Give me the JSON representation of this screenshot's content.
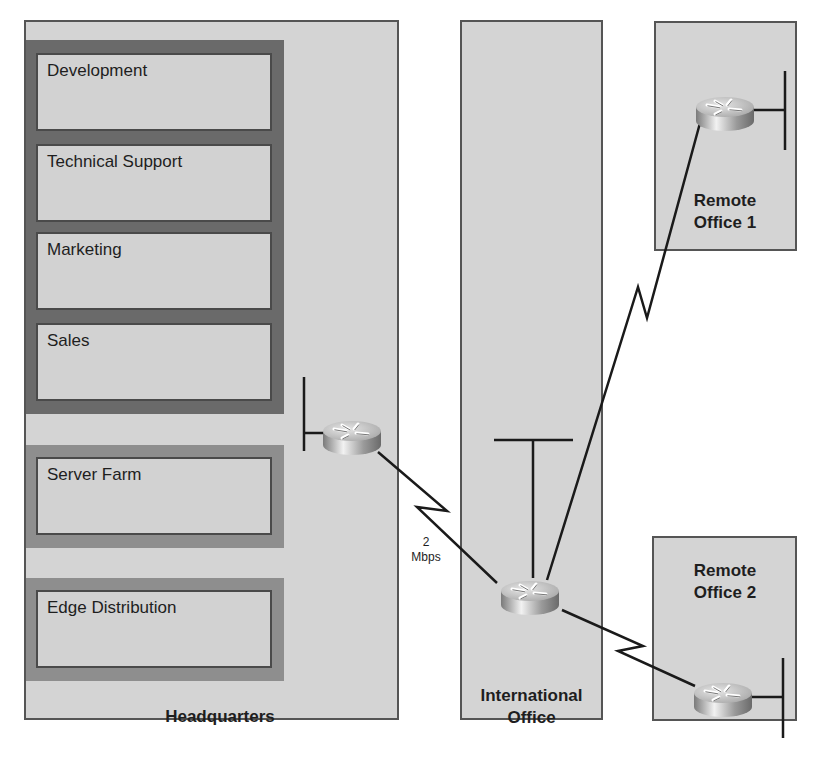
{
  "diagram": {
    "type": "network-topology",
    "sites": {
      "headquarters": {
        "label": "Headquarters",
        "departments": [
          {
            "label": "Development"
          },
          {
            "label": "Technical Support"
          },
          {
            "label": "Marketing"
          },
          {
            "label": "Sales"
          }
        ],
        "modules": [
          {
            "label": "Server Farm"
          },
          {
            "label": "Edge Distribution"
          }
        ]
      },
      "international_office": {
        "label_line1": "International",
        "label_line2": "Office"
      },
      "remote_office_1": {
        "label_line1": "Remote",
        "label_line2": "Office 1"
      },
      "remote_office_2": {
        "label_line1": "Remote",
        "label_line2": "Office 2"
      }
    },
    "links": [
      {
        "from": "Headquarters router",
        "to": "International Office router",
        "type": "serial",
        "bandwidth_line1": "2",
        "bandwidth_line2": "Mbps"
      },
      {
        "from": "International Office router",
        "to": "Remote Office 1 router",
        "type": "serial"
      },
      {
        "from": "International Office router",
        "to": "Remote Office 2 router",
        "type": "serial"
      }
    ],
    "icons": {
      "router": "router-icon",
      "lan": "lan-segment-icon"
    },
    "colors": {
      "panel_fill": "#d4d4d4",
      "panel_border": "#555555",
      "dark_group": "#6a6a6a",
      "mid_group": "#8e8e8e",
      "line": "#1a1a1a"
    }
  }
}
